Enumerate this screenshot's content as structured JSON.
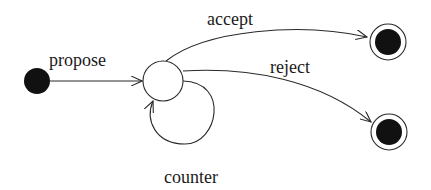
{
  "diagram": {
    "type": "state-machine",
    "colors": {
      "stroke": "#2a2a2a",
      "fill": "#111111",
      "background": "#ffffff"
    },
    "states": [
      {
        "id": "initial",
        "kind": "initial"
      },
      {
        "id": "negotiating",
        "kind": "state"
      },
      {
        "id": "accepted",
        "kind": "final"
      },
      {
        "id": "rejected",
        "kind": "final"
      }
    ],
    "transitions": [
      {
        "from": "initial",
        "to": "negotiating",
        "label": "propose"
      },
      {
        "from": "negotiating",
        "to": "accepted",
        "label": "accept"
      },
      {
        "from": "negotiating",
        "to": "rejected",
        "label": "reject"
      },
      {
        "from": "negotiating",
        "to": "negotiating",
        "label": "counter"
      }
    ]
  },
  "labels": {
    "propose": "propose",
    "accept": "accept",
    "reject": "reject",
    "counter": "counter"
  }
}
